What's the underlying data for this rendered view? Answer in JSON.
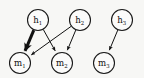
{
  "figure": {
    "background_color": "#f7f7f5",
    "node_fill": "#fbfbfa",
    "node_stroke": "#1a1a1a",
    "edge_color": "#111111",
    "width": 144,
    "height": 78
  },
  "nodes": [
    {
      "id": "h1",
      "base": "h",
      "sub": "1",
      "label": "h1",
      "x": 38,
      "y": 20,
      "r": 10.5,
      "layer": "top"
    },
    {
      "id": "h2",
      "base": "h",
      "sub": "2",
      "label": "h2",
      "x": 80,
      "y": 20,
      "r": 10.5,
      "layer": "top"
    },
    {
      "id": "h3",
      "base": "h",
      "sub": "3",
      "label": "h3",
      "x": 122,
      "y": 20,
      "r": 10.5,
      "layer": "top"
    },
    {
      "id": "m1",
      "base": "m",
      "sub": "1",
      "label": "m1",
      "x": 20,
      "y": 63,
      "r": 10.5,
      "layer": "bottom"
    },
    {
      "id": "m2",
      "base": "m",
      "sub": "2",
      "label": "m2",
      "x": 62,
      "y": 63,
      "r": 10.5,
      "layer": "bottom"
    },
    {
      "id": "m3",
      "base": "m",
      "sub": "3",
      "label": "m3",
      "x": 104,
      "y": 63,
      "r": 10.5,
      "layer": "bottom"
    }
  ],
  "edges": [
    {
      "id": "e-h1-m1",
      "from": "h1",
      "to": "m1",
      "width": 3.0,
      "emphasis": "bold",
      "arrow": true
    },
    {
      "id": "e-h1-m2",
      "from": "h1",
      "to": "m2",
      "width": 1.0,
      "emphasis": "normal",
      "arrow": true
    },
    {
      "id": "e-h2-m1",
      "from": "h2",
      "to": "m1",
      "width": 1.0,
      "emphasis": "normal",
      "arrow": true
    },
    {
      "id": "e-h2-m2",
      "from": "h2",
      "to": "m2",
      "width": 1.0,
      "emphasis": "normal",
      "arrow": true
    },
    {
      "id": "e-h3-m3",
      "from": "h3",
      "to": "m3",
      "width": 1.0,
      "emphasis": "normal",
      "arrow": true
    }
  ]
}
